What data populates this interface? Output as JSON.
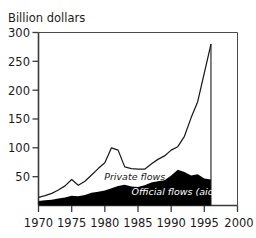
{
  "chart_data": {
    "type": "area",
    "title": "Billion dollars",
    "xlabel": "",
    "ylabel": "Billion dollars",
    "xlim": [
      1970,
      2000
    ],
    "ylim": [
      0,
      300
    ],
    "xticks": [
      1970,
      1975,
      1980,
      1985,
      1990,
      1995,
      2000
    ],
    "xtick_labels": [
      "1970",
      "1975",
      "1980",
      "1985",
      "1990",
      "1995",
      "2000"
    ],
    "yticks": [
      50,
      100,
      150,
      200,
      250,
      300
    ],
    "ytick_labels": [
      "50",
      "100",
      "150",
      "200",
      "250",
      "300"
    ],
    "grid": false,
    "legend_position": "inline-annotations",
    "x": [
      1970,
      1971,
      1972,
      1973,
      1974,
      1975,
      1976,
      1977,
      1978,
      1979,
      1980,
      1981,
      1982,
      1983,
      1984,
      1985,
      1986,
      1987,
      1988,
      1989,
      1990,
      1991,
      1992,
      1993,
      1994,
      1995,
      1996
    ],
    "series": [
      {
        "name": "Official flows (aid)",
        "stacked_order": 1,
        "fill": "#000000",
        "values": [
          8,
          9,
          10,
          12,
          14,
          17,
          16,
          18,
          22,
          24,
          26,
          30,
          34,
          36,
          33,
          32,
          35,
          40,
          42,
          44,
          52,
          62,
          58,
          52,
          54,
          47,
          45
        ]
      },
      {
        "name": "Private flows",
        "stacked_order": 2,
        "fill": "#ffffff",
        "values": [
          6,
          8,
          11,
          15,
          20,
          28,
          19,
          24,
          31,
          40,
          48,
          70,
          62,
          31,
          31,
          31,
          28,
          32,
          38,
          42,
          44,
          40,
          62,
          100,
          126,
          183,
          235
        ]
      }
    ],
    "total_line": {
      "name": "Total (Private + Official)",
      "values": [
        14,
        17,
        21,
        27,
        34,
        45,
        35,
        42,
        53,
        64,
        74,
        100,
        96,
        67,
        64,
        63,
        63,
        72,
        80,
        86,
        96,
        102,
        120,
        152,
        180,
        230,
        280
      ]
    },
    "annotations": [
      {
        "text": "Private flows",
        "x": 1984.5,
        "y": 44,
        "style": "italic",
        "color": "#1b1b1b"
      },
      {
        "text": "Official flows (aid)",
        "x": 1990.5,
        "y": 18,
        "style": "italic",
        "color": "#ffffff"
      }
    ]
  },
  "axis": {
    "title": "Billion dollars"
  }
}
